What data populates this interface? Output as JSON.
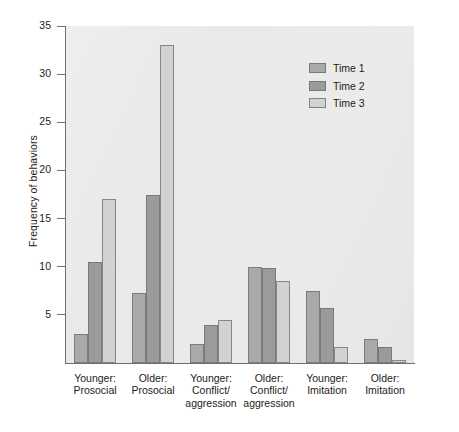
{
  "chart_data": {
    "type": "bar",
    "title": "",
    "xlabel": "",
    "ylabel": "Frequency of behaviors",
    "ylim": [
      0,
      35
    ],
    "yticks": [
      5,
      10,
      15,
      20,
      25,
      30,
      35
    ],
    "grid": false,
    "legend_position": "top-right",
    "categories": [
      "Younger:\nProsocial",
      "Older:\nProsocial",
      "Younger:\nConflict/\naggression",
      "Older:\nConflict/\naggression",
      "Younger:\nImitation",
      "Older:\nImitation"
    ],
    "category_lines": [
      [
        "Younger:",
        "Prosocial"
      ],
      [
        "Older:",
        "Prosocial"
      ],
      [
        "Younger:",
        "Conflict/",
        "aggression"
      ],
      [
        "Older:",
        "Conflict/",
        "aggression"
      ],
      [
        "Younger:",
        "Imitation"
      ],
      [
        "Older:",
        "Imitation"
      ]
    ],
    "series": [
      {
        "name": "Time 1",
        "color": "#a9a9a9",
        "values": [
          3.0,
          7.3,
          2.0,
          10.0,
          7.5,
          2.5
        ]
      },
      {
        "name": "Time 2",
        "color": "#9b9b9b",
        "values": [
          10.5,
          17.5,
          4.0,
          9.9,
          5.7,
          1.7
        ]
      },
      {
        "name": "Time 3",
        "color": "#d2d2d2",
        "values": [
          17.0,
          33.0,
          4.5,
          8.5,
          1.7,
          0.3
        ]
      }
    ]
  },
  "legend": {
    "items": [
      {
        "label": "Time 1",
        "color": "#a9a9a9"
      },
      {
        "label": "Time 2",
        "color": "#9b9b9b"
      },
      {
        "label": "Time 3",
        "color": "#d2d2d2"
      }
    ]
  },
  "axes": {
    "y_title": "Frequency of behaviors",
    "y_tick_labels": [
      "35",
      "30",
      "25",
      "20",
      "15",
      "10",
      "5"
    ]
  }
}
